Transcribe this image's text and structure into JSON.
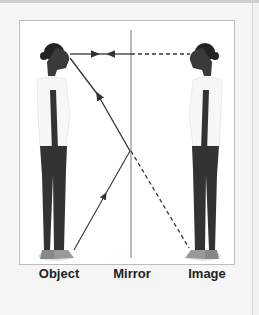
{
  "diagram": {
    "labels": {
      "object": "Object",
      "mirror": "Mirror",
      "image": "Image"
    },
    "rays": [
      {
        "name": "eye-to-mirror-horizontal",
        "style": "solid",
        "direction": "toward-mirror-and-back"
      },
      {
        "name": "foot-to-mirror-incident",
        "style": "solid",
        "direction": "up-toward-mirror"
      },
      {
        "name": "mirror-to-eye-reflected",
        "style": "solid",
        "direction": "up-toward-eye"
      },
      {
        "name": "virtual-ray-to-image-feet",
        "style": "dashed"
      },
      {
        "name": "virtual-ray-to-image-eye",
        "style": "dashed"
      }
    ],
    "colors": {
      "ray": "#333333",
      "mirror": "#bbbbbb",
      "background": "#ffffff",
      "frame": "#f5f5f5"
    }
  }
}
